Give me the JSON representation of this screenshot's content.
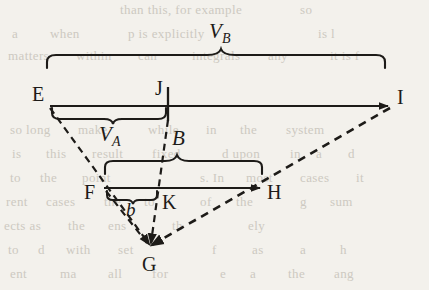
{
  "figure": {
    "kind": "geometry-diagram",
    "ink_color": "#1d1b18",
    "background_color": "#f3f1ec",
    "points": [
      {
        "id": "E",
        "label": "E",
        "x": 50,
        "y": 106,
        "label_x": 33,
        "label_y": 86
      },
      {
        "id": "J",
        "label": "J",
        "x": 168,
        "y": 106,
        "label_x": 155,
        "label_y": 80
      },
      {
        "id": "I",
        "label": "I",
        "x": 390,
        "y": 106,
        "label_x": 396,
        "label_y": 89
      },
      {
        "id": "F",
        "label": "F",
        "x": 104,
        "y": 188,
        "label_x": 85,
        "label_y": 183
      },
      {
        "id": "K",
        "label": "K",
        "x": 158,
        "y": 188,
        "label_x": 162,
        "label_y": 192
      },
      {
        "id": "H",
        "label": "H",
        "x": 262,
        "y": 188,
        "label_x": 267,
        "label_y": 183
      },
      {
        "id": "G",
        "label": "G",
        "x": 150,
        "y": 248,
        "label_x": 142,
        "label_y": 252
      }
    ],
    "braces": [
      {
        "id": "brace-vb",
        "label": "V_B",
        "label_text": "V",
        "label_sub": "B",
        "from_x": 47,
        "to_x": 385,
        "y": 68,
        "label_x": 210,
        "label_y": 16,
        "direction": "up"
      },
      {
        "id": "brace-va",
        "label": "V_A",
        "label_text": "V",
        "label_sub": "A",
        "from_x": 52,
        "to_x": 166,
        "y": 110,
        "label_x": 100,
        "label_y": 120,
        "direction": "down"
      },
      {
        "id": "brace-b-upper",
        "label": "B",
        "label_text": "B",
        "label_sub": "",
        "from_x": 105,
        "to_x": 262,
        "y": 172,
        "label_x": 172,
        "label_y": 122,
        "direction": "up"
      },
      {
        "id": "brace-b-lower",
        "label": "b",
        "label_text": "b",
        "label_sub": "",
        "from_x": 107,
        "to_x": 157,
        "y": 192,
        "label_x": 126,
        "label_y": 199,
        "direction": "down"
      }
    ],
    "solid_lines": [
      {
        "id": "segment-EI",
        "x1": 50,
        "y1": 106,
        "x2": 390,
        "y2": 106,
        "arrow": true
      },
      {
        "id": "segment-FH",
        "x1": 104,
        "y1": 188,
        "x2": 262,
        "y2": 188,
        "arrow": true
      },
      {
        "id": "tick-J",
        "x1": 168,
        "y1": 88,
        "x2": 168,
        "y2": 120,
        "arrow": false
      }
    ],
    "dashed_lines": [
      {
        "id": "ray-E-G",
        "x1": 50,
        "y1": 107,
        "x2": 150,
        "y2": 246,
        "arrow": true
      },
      {
        "id": "ray-I-G",
        "x1": 390,
        "y1": 107,
        "x2": 150,
        "y2": 246,
        "arrow": true
      },
      {
        "id": "ray-J-G",
        "x1": 168,
        "y1": 118,
        "x2": 150,
        "y2": 246,
        "arrow": true
      },
      {
        "id": "ray-F-G",
        "x1": 105,
        "y1": 190,
        "x2": 150,
        "y2": 246,
        "arrow": true
      }
    ],
    "labels": [
      {
        "id": "label-VB",
        "text": "V",
        "sub": "B"
      },
      {
        "id": "label-VA",
        "text": "V",
        "sub": "A"
      },
      {
        "id": "label-B",
        "text": "B",
        "sub": ""
      },
      {
        "id": "label-b",
        "text": "b",
        "sub": ""
      }
    ]
  },
  "page_bleed_text": {
    "note": "faint show-through text from the reverse side of the printed page",
    "lines": [
      {
        "text": "than this, for example",
        "x": 120,
        "y": 2
      },
      {
        "text": "so",
        "x": 300,
        "y": 2
      },
      {
        "text": "a",
        "x": 12,
        "y": 26
      },
      {
        "text": "when",
        "x": 50,
        "y": 26
      },
      {
        "text": "p is explicitly",
        "x": 128,
        "y": 26
      },
      {
        "text": "is l",
        "x": 318,
        "y": 26
      },
      {
        "text": "matters",
        "x": 8,
        "y": 48
      },
      {
        "text": "within",
        "x": 76,
        "y": 48
      },
      {
        "text": "can",
        "x": 138,
        "y": 48
      },
      {
        "text": "integrals",
        "x": 192,
        "y": 48
      },
      {
        "text": "any",
        "x": 268,
        "y": 48
      },
      {
        "text": "it is f",
        "x": 330,
        "y": 48
      },
      {
        "text": "so long",
        "x": 10,
        "y": 122
      },
      {
        "text": "make",
        "x": 78,
        "y": 122
      },
      {
        "text": "while",
        "x": 148,
        "y": 122
      },
      {
        "text": "in",
        "x": 206,
        "y": 122
      },
      {
        "text": "the",
        "x": 240,
        "y": 122
      },
      {
        "text": "system",
        "x": 286,
        "y": 122
      },
      {
        "text": "is",
        "x": 12,
        "y": 146
      },
      {
        "text": "this",
        "x": 46,
        "y": 146
      },
      {
        "text": "result",
        "x": 92,
        "y": 146
      },
      {
        "text": "fixed",
        "x": 152,
        "y": 146
      },
      {
        "text": "d upon",
        "x": 222,
        "y": 146
      },
      {
        "text": "in",
        "x": 290,
        "y": 146
      },
      {
        "text": "a",
        "x": 316,
        "y": 146
      },
      {
        "text": "d",
        "x": 348,
        "y": 146
      },
      {
        "text": "to",
        "x": 10,
        "y": 170
      },
      {
        "text": "the",
        "x": 40,
        "y": 170
      },
      {
        "text": "point",
        "x": 82,
        "y": 170
      },
      {
        "text": "s. In",
        "x": 200,
        "y": 170
      },
      {
        "text": "most",
        "x": 246,
        "y": 170
      },
      {
        "text": "cases",
        "x": 300,
        "y": 170
      },
      {
        "text": "it",
        "x": 356,
        "y": 170
      },
      {
        "text": "rent",
        "x": 6,
        "y": 194
      },
      {
        "text": "cases",
        "x": 46,
        "y": 194
      },
      {
        "text": "the",
        "x": 104,
        "y": 194
      },
      {
        "text": "to",
        "x": 144,
        "y": 194
      },
      {
        "text": "of",
        "x": 200,
        "y": 194
      },
      {
        "text": "the",
        "x": 236,
        "y": 194
      },
      {
        "text": "g",
        "x": 300,
        "y": 194
      },
      {
        "text": "sum",
        "x": 330,
        "y": 194
      },
      {
        "text": "ects as",
        "x": 4,
        "y": 218
      },
      {
        "text": "the",
        "x": 68,
        "y": 218
      },
      {
        "text": "ens",
        "x": 108,
        "y": 218
      },
      {
        "text": "th",
        "x": 172,
        "y": 218
      },
      {
        "text": "ely",
        "x": 248,
        "y": 218
      },
      {
        "text": "to",
        "x": 8,
        "y": 242
      },
      {
        "text": "d",
        "x": 38,
        "y": 242
      },
      {
        "text": "with",
        "x": 66,
        "y": 242
      },
      {
        "text": "set",
        "x": 118,
        "y": 242
      },
      {
        "text": "f",
        "x": 212,
        "y": 242
      },
      {
        "text": "as",
        "x": 252,
        "y": 242
      },
      {
        "text": "a",
        "x": 300,
        "y": 242
      },
      {
        "text": "h",
        "x": 340,
        "y": 242
      },
      {
        "text": "ent",
        "x": 10,
        "y": 266
      },
      {
        "text": "ma",
        "x": 60,
        "y": 266
      },
      {
        "text": "all",
        "x": 108,
        "y": 266
      },
      {
        "text": "for",
        "x": 152,
        "y": 266
      },
      {
        "text": "e",
        "x": 220,
        "y": 266
      },
      {
        "text": "a",
        "x": 250,
        "y": 266
      },
      {
        "text": "the",
        "x": 288,
        "y": 266
      },
      {
        "text": "ang",
        "x": 334,
        "y": 266
      }
    ]
  }
}
